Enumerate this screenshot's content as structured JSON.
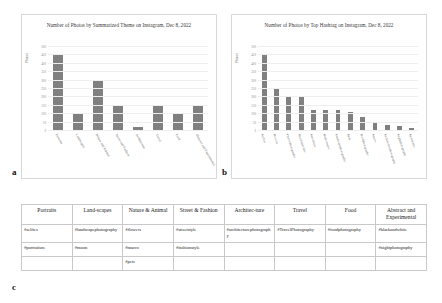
{
  "figure": {
    "panel_labels": {
      "a": "a",
      "b": "b",
      "c": "c"
    }
  },
  "chart_data": [
    {
      "panel": "a",
      "type": "bar",
      "title": "Number of Photos by Summarized Theme on Instagram, Dec 8, 2022",
      "xlabel": "",
      "ylabel": "Photos",
      "categories": [
        "Portraits",
        "Landscapes",
        "Nature and Animal",
        "Street and Fashion",
        "Architecture",
        "Travel",
        "Food",
        "Abstract and Experimental"
      ],
      "values": [
        450,
        100,
        300,
        150,
        15,
        150,
        100,
        150
      ],
      "ylim": [
        0,
        500
      ],
      "yticks": [
        0,
        50,
        100,
        150,
        200,
        250,
        300,
        350,
        400,
        450,
        500
      ],
      "grid": true,
      "legend": "none",
      "bar_color": "#808080"
    },
    {
      "panel": "b",
      "type": "bar",
      "title": "Number of Photos by Top Hashtag on Instagram, Dec 8, 2022",
      "xlabel": "",
      "ylabel": "Photos",
      "categories": [
        "#selfies",
        "#flowers",
        "#TravelPhotography",
        "#blackandwhite",
        "#streetstyle",
        "#fashionstyle",
        "#landscapephotography",
        "#pets",
        "#foodphotography",
        "#macro",
        "#architecturephotography",
        "#nightphotography",
        "#portraiture"
      ],
      "values": [
        450,
        250,
        200,
        200,
        120,
        120,
        120,
        110,
        75,
        45,
        30,
        25,
        10
      ],
      "ylim": [
        0,
        500
      ],
      "yticks": [
        0,
        50,
        100,
        150,
        200,
        250,
        300,
        350,
        400,
        450,
        500
      ],
      "grid": true,
      "legend": "none",
      "bar_color": "#808080"
    }
  ],
  "table": {
    "headers": [
      "Portraits",
      "Land-scapes",
      "Nature & Animal",
      "Street & Fashion",
      "Architec-ture",
      "Travel",
      "Food",
      "Abstract and Experimental"
    ],
    "rows": [
      [
        "#selfies",
        "#landscapephotography",
        "#flowers",
        "#streetstyle",
        "#architecturephotography",
        "#TravelPhotography",
        "#foodphotography",
        "#blackandwhite"
      ],
      [
        "#portraiture",
        "#moon",
        "#macro",
        "#fashionstyle",
        "",
        "",
        "",
        "#nightphotography"
      ],
      [
        "",
        "",
        "#pets",
        "",
        "",
        "",
        "",
        ""
      ]
    ]
  }
}
